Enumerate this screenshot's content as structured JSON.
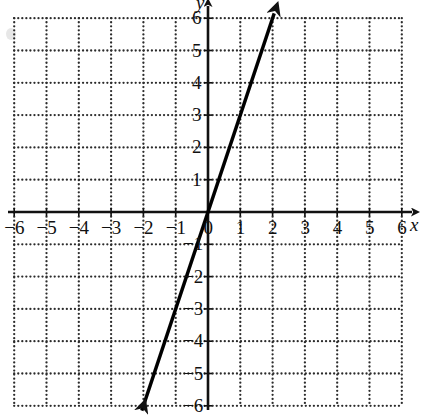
{
  "chart_data": {
    "type": "line",
    "title": "",
    "xlabel": "x",
    "ylabel": "y",
    "grid": true,
    "grid_style": "dotted",
    "grid_step": 1,
    "legend": "none",
    "xlim": [
      -6.4,
      6.4
    ],
    "ylim": [
      -6.4,
      6.4
    ],
    "xticks": [
      -6,
      -5,
      -4,
      -3,
      -2,
      -1,
      0,
      1,
      2,
      3,
      4,
      5,
      6
    ],
    "yticks": [
      -6,
      -5,
      -4,
      -3,
      -2,
      -1,
      1,
      2,
      3,
      4,
      5,
      6
    ],
    "xtick_labels": [
      "−6",
      "−5",
      "−4",
      "−3",
      "−2",
      "−1",
      "0",
      "1",
      "2",
      "3",
      "4",
      "5",
      "6"
    ],
    "ytick_labels": [
      "−6",
      "−5",
      "−4",
      "−3",
      "−2",
      "−1",
      "1",
      "2",
      "3",
      "4",
      "5",
      "6"
    ],
    "series": [
      {
        "name": "line",
        "equation": "y = 3x",
        "slope": 3,
        "intercept": 0,
        "x": [
          -2.05,
          2.05
        ],
        "values": [
          -6.15,
          6.15
        ],
        "arrow_start": true,
        "arrow_end": true,
        "color": "#000000"
      }
    ],
    "axis_arrows": {
      "x_positive": true,
      "y_positive": true
    }
  },
  "axes": {
    "x_label": "x",
    "y_label": "y"
  },
  "ticks": {
    "x": [
      {
        "value": -6,
        "label": "−6"
      },
      {
        "value": -5,
        "label": "−5"
      },
      {
        "value": -4,
        "label": "−4"
      },
      {
        "value": -3,
        "label": "−3"
      },
      {
        "value": -2,
        "label": "−2"
      },
      {
        "value": -1,
        "label": "−1"
      },
      {
        "value": 0,
        "label": "0"
      },
      {
        "value": 1,
        "label": "1"
      },
      {
        "value": 2,
        "label": "2"
      },
      {
        "value": 3,
        "label": "3"
      },
      {
        "value": 4,
        "label": "4"
      },
      {
        "value": 5,
        "label": "5"
      },
      {
        "value": 6,
        "label": "6"
      }
    ],
    "y": [
      {
        "value": 6,
        "label": "6"
      },
      {
        "value": 5,
        "label": "5"
      },
      {
        "value": 4,
        "label": "4"
      },
      {
        "value": 3,
        "label": "3"
      },
      {
        "value": 2,
        "label": "2"
      },
      {
        "value": 1,
        "label": "1"
      },
      {
        "value": -1,
        "label": "−1"
      },
      {
        "value": -2,
        "label": "−2"
      },
      {
        "value": -3,
        "label": "−3"
      },
      {
        "value": -4,
        "label": "−4"
      },
      {
        "value": -5,
        "label": "−5"
      },
      {
        "value": -6,
        "label": "−6"
      }
    ]
  }
}
